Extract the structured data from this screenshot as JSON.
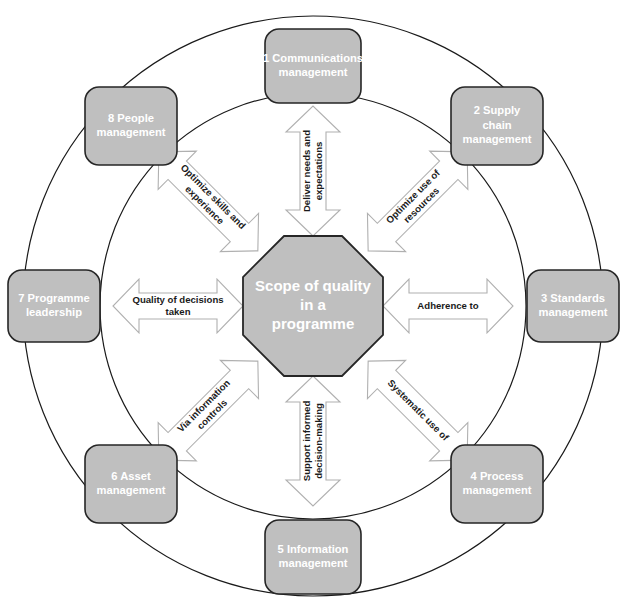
{
  "diagram": {
    "center": {
      "shape": "octagon",
      "lines": [
        "Scope of quality",
        "in a",
        "programme"
      ],
      "fill": "#bfbfbf",
      "text_color": "#ffffff"
    },
    "style": {
      "node_fill": "#bfbfbf",
      "node_stroke": "#262626",
      "node_text": "#ffffff",
      "arrow_fill": "#ffffff",
      "arrow_stroke": "#b0b0b0",
      "ring_stroke": "#1a1a1a",
      "label_text": "#1a1a1a",
      "background": "#ffffff"
    },
    "rings": [
      {
        "name": "outer-ring",
        "cx": 313,
        "cy": 306,
        "r": 290
      },
      {
        "name": "inner-ring",
        "cx": 313,
        "cy": 306,
        "r": 213
      }
    ],
    "nodes": [
      {
        "id": 1,
        "number": "1",
        "name": "communications-management",
        "lines": [
          "1 Communications",
          "management"
        ],
        "cx": 313,
        "cy": 66,
        "w": 96,
        "h": 74
      },
      {
        "id": 2,
        "number": "2",
        "name": "supply-chain-management",
        "lines": [
          "2 Supply",
          "chain",
          "management"
        ],
        "cx": 497,
        "cy": 126,
        "w": 92,
        "h": 78
      },
      {
        "id": 3,
        "number": "3",
        "name": "standards-management",
        "lines": [
          "3 Standards",
          "management"
        ],
        "cx": 573,
        "cy": 306,
        "w": 92,
        "h": 72
      },
      {
        "id": 4,
        "number": "4",
        "name": "process-management",
        "lines": [
          "4 Process",
          "management"
        ],
        "cx": 497,
        "cy": 484,
        "w": 92,
        "h": 78
      },
      {
        "id": 5,
        "number": "5",
        "name": "information-management",
        "lines": [
          "5 Information",
          "management"
        ],
        "cx": 313,
        "cy": 557,
        "w": 96,
        "h": 74
      },
      {
        "id": 6,
        "number": "6",
        "name": "asset-management",
        "lines": [
          "6 Asset",
          "management"
        ],
        "cx": 131,
        "cy": 484,
        "w": 92,
        "h": 78
      },
      {
        "id": 7,
        "number": "7",
        "name": "programme-leadership",
        "lines": [
          "7 Programme",
          "leadership"
        ],
        "cx": 54,
        "cy": 306,
        "w": 92,
        "h": 72
      },
      {
        "id": 8,
        "number": "8",
        "name": "people-management",
        "lines": [
          "8 People",
          "management"
        ],
        "cx": 131,
        "cy": 126,
        "w": 92,
        "h": 78
      }
    ],
    "connectors": [
      {
        "name": "connector-communications",
        "to_node": 1,
        "angle": -90,
        "double_headed": true,
        "lines": [
          "Deliver needs and",
          "expectations"
        ],
        "label_rotation": -90
      },
      {
        "name": "connector-supply-chain",
        "to_node": 2,
        "angle": -45,
        "double_headed": true,
        "lines": [
          "Optimize use of",
          "resources"
        ],
        "label_rotation": -45
      },
      {
        "name": "connector-standards",
        "to_node": 3,
        "angle": 0,
        "double_headed": true,
        "lines": [
          "Adherence to"
        ],
        "label_rotation": 0
      },
      {
        "name": "connector-process",
        "to_node": 4,
        "angle": 45,
        "double_headed": true,
        "lines": [
          "Systematic use of"
        ],
        "label_rotation": 45
      },
      {
        "name": "connector-information",
        "to_node": 5,
        "angle": 90,
        "double_headed": true,
        "lines": [
          "Support informed",
          "decision-making"
        ],
        "label_rotation": -90
      },
      {
        "name": "connector-asset",
        "to_node": 6,
        "angle": 135,
        "double_headed": true,
        "lines": [
          "Via information",
          "controls"
        ],
        "label_rotation": -45
      },
      {
        "name": "connector-programme-leadership",
        "to_node": 7,
        "angle": 180,
        "double_headed": true,
        "lines": [
          "Quality of decisions",
          "taken"
        ],
        "label_rotation": 0
      },
      {
        "name": "connector-people",
        "to_node": 8,
        "angle": -135,
        "double_headed": true,
        "lines": [
          "Optimize skills and",
          "experience"
        ],
        "label_rotation": 45
      }
    ]
  }
}
